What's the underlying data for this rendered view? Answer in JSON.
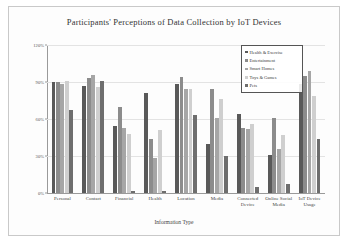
{
  "chart_data": {
    "type": "bar",
    "title": "Participants' Perceptions of Data Collection by IoT Devices",
    "xlabel": "Information Type",
    "ylabel": "",
    "ylim": [
      0,
      120
    ],
    "ytick_labels": [
      "120%",
      "90%",
      "60%",
      "30%",
      "0%"
    ],
    "ytick_values": [
      120,
      90,
      60,
      30,
      0
    ],
    "grid": true,
    "legend_position": "top-right",
    "categories": [
      "Personal",
      "Contact",
      "Financial",
      "Health",
      "Location",
      "Media",
      "Connected Device",
      "Online Social Media",
      "IoT Device Usage"
    ],
    "series": [
      {
        "name": "Health & Exercise",
        "color": "#595959",
        "values": [
          90,
          87,
          54,
          81,
          88,
          40,
          64,
          31,
          88
        ]
      },
      {
        "name": "Entertainment",
        "color": "#8c8c8c",
        "values": [
          90,
          93,
          70,
          44,
          94,
          84,
          53,
          61,
          95
        ]
      },
      {
        "name": "Smart Homes",
        "color": "#a6a6a6",
        "values": [
          88,
          96,
          53,
          28,
          84,
          61,
          52,
          36,
          99
        ]
      },
      {
        "name": "Toys & Games",
        "color": "#cfcfcf",
        "values": [
          91,
          86,
          48,
          51,
          84,
          76,
          56,
          47,
          79
        ]
      },
      {
        "name": "Pets",
        "color": "#6e6e6e",
        "values": [
          67,
          91,
          2,
          2,
          63,
          30,
          5,
          7,
          44
        ]
      }
    ]
  },
  "legend": {
    "items": [
      {
        "label": "Health & Exercise"
      },
      {
        "label": "Entertainment"
      },
      {
        "label": "Smart Homes"
      },
      {
        "label": "Toys & Games"
      },
      {
        "label": "Pets"
      }
    ]
  }
}
